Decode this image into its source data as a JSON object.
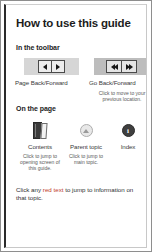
{
  "page": {
    "title": "How to use this guide"
  },
  "toolbar_section": {
    "heading": "In the toolbar",
    "page_nav": {
      "back_icon": "triangle-left-icon",
      "forward_icon": "triangle-right-icon",
      "caption": "Page Back/Forward"
    },
    "go_nav": {
      "back_icon": "double-triangle-left-icon",
      "forward_icon": "double-triangle-right-icon",
      "caption": "Go Back/Forward",
      "subcaption": "Click to move to your previous location."
    }
  },
  "page_section": {
    "heading": "On the page",
    "items": [
      {
        "icon": "book-icon",
        "label": "Contents",
        "subcaption": "Click to jump to opening screen of this guide."
      },
      {
        "icon": "up-arrow-circle-icon",
        "label": "Parent topic",
        "subcaption": "Click to jump to main topic."
      },
      {
        "icon": "info-circle-icon",
        "label": "Index",
        "glyph": "i",
        "subcaption": ""
      }
    ]
  },
  "footer": {
    "text_before": "Click any ",
    "highlight": "red text",
    "text_after": " to jump to information on that topic.",
    "highlight_color": "#c0392b"
  }
}
